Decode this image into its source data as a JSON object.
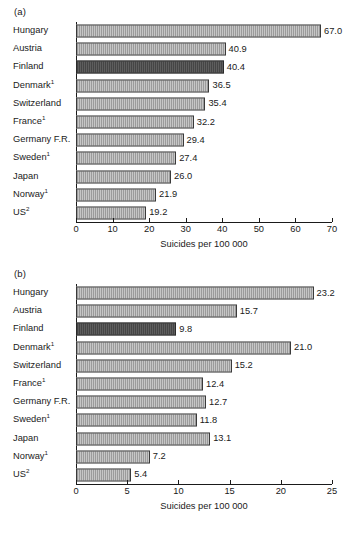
{
  "figure": {
    "panels": [
      {
        "id": "a",
        "label": "(a)"
      },
      {
        "id": "b",
        "label": "(b)"
      }
    ]
  },
  "chart_data": [
    {
      "panel": "(a)",
      "type": "bar",
      "orientation": "horizontal",
      "title": "",
      "xlabel": "Suicides per 100 000",
      "ylabel": "",
      "xlim": [
        0,
        70
      ],
      "xticks": [
        0,
        10,
        20,
        30,
        40,
        50,
        60,
        70
      ],
      "xtick_labels": [
        "0",
        "10",
        "20",
        "30",
        "40",
        "50",
        "60",
        "70"
      ],
      "grid": false,
      "legend": "none",
      "highlight_category": "Finland",
      "highlight_color": "#6e6e6e",
      "bar_color": "#e4e4e4",
      "bar_edge_color": "#3a3a3a",
      "categories": [
        "Hungary",
        "Austria",
        "Finland",
        "Denmark",
        "Switzerland",
        "France",
        "Germany F.R.",
        "Sweden",
        "Japan",
        "Norway",
        "US"
      ],
      "category_footnotes": [
        "",
        "",
        "",
        "1",
        "",
        "1",
        "",
        "1",
        "",
        "1",
        "2"
      ],
      "values": [
        67.0,
        40.9,
        40.4,
        36.5,
        35.4,
        32.2,
        29.4,
        27.4,
        26.0,
        21.9,
        19.2
      ],
      "value_labels": [
        "67.0",
        "40.9",
        "40.4",
        "36.5",
        "35.4",
        "32.2",
        "29.4",
        "27.4",
        "26.0",
        "21.9",
        "19.2"
      ]
    },
    {
      "panel": "(b)",
      "type": "bar",
      "orientation": "horizontal",
      "title": "",
      "xlabel": "Suicides per 100 000",
      "ylabel": "",
      "xlim": [
        0,
        25
      ],
      "xticks": [
        0,
        5,
        10,
        15,
        20,
        25
      ],
      "xtick_labels": [
        "0",
        "5",
        "10",
        "15",
        "20",
        "25"
      ],
      "grid": false,
      "legend": "none",
      "highlight_category": "Finland",
      "highlight_color": "#6e6e6e",
      "bar_color": "#e4e4e4",
      "bar_edge_color": "#3a3a3a",
      "categories": [
        "Hungary",
        "Austria",
        "Finland",
        "Denmark",
        "Switzerland",
        "France",
        "Germany F.R.",
        "Sweden",
        "Japan",
        "Norway",
        "US"
      ],
      "category_footnotes": [
        "",
        "",
        "",
        "1",
        "",
        "1",
        "",
        "1",
        "",
        "1",
        "2"
      ],
      "values": [
        23.2,
        15.7,
        9.8,
        21.0,
        15.2,
        12.4,
        12.7,
        11.8,
        13.1,
        7.2,
        5.4
      ],
      "value_labels": [
        "23.2",
        "15.7",
        "9.8",
        "21.0",
        "15.2",
        "12.4",
        "12.7",
        "11.8",
        "13.1",
        "7.2",
        "5.4"
      ]
    }
  ]
}
